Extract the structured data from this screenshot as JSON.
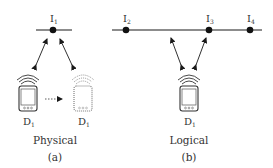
{
  "panels": {
    "a": {
      "caption": "(a)",
      "title": "Physical",
      "node": {
        "label": "I",
        "sub": "1"
      },
      "device": {
        "label": "D",
        "sub": "1"
      },
      "ghost_device": {
        "label": "D",
        "sub": "1"
      }
    },
    "b": {
      "caption": "(b)",
      "title": "Logical",
      "nodes": [
        {
          "label": "I",
          "sub": "2"
        },
        {
          "label": "I",
          "sub": "3"
        },
        {
          "label": "I",
          "sub": "4"
        }
      ],
      "device": {
        "label": "D",
        "sub": "1"
      }
    }
  },
  "colors": {
    "ink": "#1a1a1a",
    "text": "#333333",
    "ghost": "#8a8a8a"
  }
}
